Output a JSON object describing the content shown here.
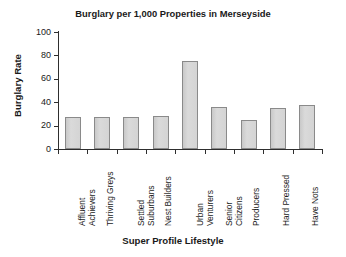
{
  "figure": {
    "top_clipped_text": "",
    "xlabel": "Super Profile Lifestyle",
    "ylabel": "Burglary Rate",
    "bar_fill_color": "#d4d4d4",
    "bar_border_color": "#8a8a8a",
    "axis_color": "#2e2e2e",
    "background_color": "#ffffff"
  },
  "chart_data": {
    "type": "bar",
    "title": "Burglary per 1,000 Properties in Merseyside",
    "xlabel": "Super Profile Lifestyle",
    "ylabel": "Burglary Rate",
    "categories": [
      "Affluent Achievers",
      "Thriving Greys",
      "Settled Suburbans",
      "Nest Builders",
      "Urban Venturers",
      "Senior Citizens",
      "Producers",
      "Hard Pressed",
      "Have Nots"
    ],
    "category_lines": [
      [
        "Affluent",
        "Achievers"
      ],
      [
        "Thriving Greys"
      ],
      [
        "Settled",
        "Suburbans"
      ],
      [
        "Nest Builders"
      ],
      [
        "Urban",
        "Venturers"
      ],
      [
        "Senior",
        "Citizens"
      ],
      [
        "Producers"
      ],
      [
        "Hard Pressed"
      ],
      [
        "Have Nots"
      ]
    ],
    "values": [
      27,
      27,
      27,
      28,
      75,
      36,
      25,
      35,
      38
    ],
    "ylim": [
      0,
      100
    ],
    "yticks": [
      0,
      20,
      40,
      60,
      80,
      100
    ],
    "ytick_labels": [
      "0",
      "20",
      "40",
      "60",
      "80",
      "100"
    ],
    "grid": false,
    "legend": null
  }
}
